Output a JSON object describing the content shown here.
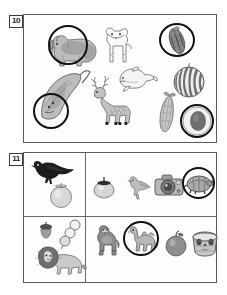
{
  "page": {
    "background": "#ffffff",
    "width": 227,
    "height": 295
  },
  "panels": [
    {
      "number": "10",
      "layout": "free",
      "items": [
        {
          "id": "rhinoceros",
          "label": "rhinoceros",
          "circled": true,
          "style": "shaded-drawing"
        },
        {
          "id": "dog",
          "label": "dog",
          "circled": false,
          "style": "line-drawing"
        },
        {
          "id": "corn-dark",
          "label": "dark-corn-cob",
          "circled": true,
          "style": "shaded-drawing"
        },
        {
          "id": "melon",
          "label": "striped-melon",
          "circled": false,
          "style": "shaded-drawing"
        },
        {
          "id": "stingray",
          "label": "stingray",
          "circled": true,
          "style": "shaded-drawing"
        },
        {
          "id": "deer",
          "label": "deer",
          "circled": false,
          "style": "shaded-drawing"
        },
        {
          "id": "dolphin",
          "label": "dolphin",
          "circled": false,
          "style": "line-drawing"
        },
        {
          "id": "corn",
          "label": "corn-cob",
          "circled": false,
          "style": "shaded-drawing"
        },
        {
          "id": "dark-ball",
          "label": "dark-round-object",
          "circled": true,
          "style": "shaded-drawing"
        }
      ]
    },
    {
      "number": "11",
      "layout": "2x2-grid",
      "cells": [
        {
          "id": "cell-top-left",
          "items": [
            {
              "id": "crow",
              "label": "crow",
              "circled": false,
              "style": "silhouette"
            },
            {
              "id": "persimmon1",
              "label": "persimmon",
              "circled": false,
              "style": "shaded-drawing"
            }
          ]
        },
        {
          "id": "cell-top-right",
          "items": [
            {
              "id": "persimmon2",
              "label": "persimmon",
              "circled": false,
              "style": "shaded-drawing"
            },
            {
              "id": "bird",
              "label": "small-bird",
              "circled": false,
              "style": "shaded-drawing"
            },
            {
              "id": "camera",
              "label": "camera",
              "circled": false,
              "style": "shaded-drawing"
            },
            {
              "id": "tortoise",
              "label": "tortoise",
              "circled": true,
              "style": "shaded-drawing"
            }
          ]
        },
        {
          "id": "cell-bottom-left",
          "items": [
            {
              "id": "acorn",
              "label": "acorn",
              "circled": false,
              "style": "shaded-drawing"
            },
            {
              "id": "dango",
              "label": "dango-skewer",
              "circled": false,
              "style": "line-drawing"
            },
            {
              "id": "lion",
              "label": "lion",
              "circled": false,
              "style": "shaded-drawing"
            }
          ]
        },
        {
          "id": "cell-bottom-right",
          "items": [
            {
              "id": "gorilla",
              "label": "gorilla",
              "circled": false,
              "style": "shaded-drawing"
            },
            {
              "id": "camel",
              "label": "camel",
              "circled": true,
              "style": "shaded-drawing"
            },
            {
              "id": "apple",
              "label": "apple",
              "circled": false,
              "style": "shaded-drawing"
            },
            {
              "id": "basket",
              "label": "patterned-basket",
              "circled": false,
              "style": "shaded-drawing"
            }
          ]
        }
      ]
    }
  ],
  "colors": {
    "annotation": "#111111",
    "panel_border": "#5a5a5a",
    "number_border": "#3a3a3a",
    "ink": "#555555",
    "fill_light": "#c9c9c9",
    "fill_mid": "#a8a8a8",
    "fill_dark": "#6f6f6f",
    "silhouette": "#1d1d1d"
  }
}
